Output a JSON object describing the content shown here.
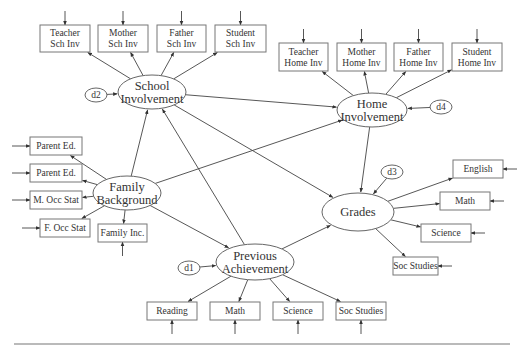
{
  "diagram": {
    "type": "structural-equation-path-model",
    "colors": {
      "stroke": "#444444",
      "box_border": "#777777",
      "text": "#333333",
      "background": "#ffffff"
    },
    "latent": [
      {
        "id": "school",
        "lines": [
          "School",
          "Involvement"
        ],
        "cx": 152,
        "cy": 92,
        "rx": 34,
        "ry": 17
      },
      {
        "id": "home",
        "lines": [
          "Home",
          "Involvement"
        ],
        "cx": 372,
        "cy": 110,
        "rx": 35,
        "ry": 17
      },
      {
        "id": "family",
        "lines": [
          "Family",
          "Background"
        ],
        "cx": 127,
        "cy": 193,
        "rx": 34,
        "ry": 17
      },
      {
        "id": "grades",
        "lines": [
          "Grades"
        ],
        "cx": 358,
        "cy": 212,
        "rx": 36,
        "ry": 19
      },
      {
        "id": "prev",
        "lines": [
          "Previous",
          "Achievement"
        ],
        "cx": 255,
        "cy": 262,
        "rx": 39,
        "ry": 18
      }
    ],
    "errors": [
      {
        "id": "d2",
        "label": "d2",
        "cx": 96,
        "cy": 95,
        "target": "school"
      },
      {
        "id": "d4",
        "label": "d4",
        "cx": 441,
        "cy": 107,
        "target": "home"
      },
      {
        "id": "d3",
        "label": "d3",
        "cx": 392,
        "cy": 172,
        "target": "grades"
      },
      {
        "id": "d1",
        "label": "d1",
        "cx": 189,
        "cy": 268,
        "target": "prev"
      }
    ],
    "indicators": [
      {
        "id": "t_sch",
        "lines": [
          "Teacher",
          "Sch Inv"
        ],
        "x": 40,
        "y": 25,
        "w": 50,
        "h": 27,
        "factor": "school",
        "err": "top"
      },
      {
        "id": "m_sch",
        "lines": [
          "Mother",
          "Sch Inv"
        ],
        "x": 98,
        "y": 25,
        "w": 50,
        "h": 27,
        "factor": "school",
        "err": "top"
      },
      {
        "id": "f_sch",
        "lines": [
          "Father",
          "Sch Inv"
        ],
        "x": 157,
        "y": 25,
        "w": 49,
        "h": 27,
        "factor": "school",
        "err": "top"
      },
      {
        "id": "s_sch",
        "lines": [
          "Student",
          "Sch Inv"
        ],
        "x": 215,
        "y": 25,
        "w": 51,
        "h": 27,
        "factor": "school",
        "err": "top"
      },
      {
        "id": "t_home",
        "lines": [
          "Teacher",
          "Home Inv"
        ],
        "x": 279,
        "y": 43,
        "w": 49,
        "h": 28,
        "factor": "home",
        "err": "top"
      },
      {
        "id": "m_home",
        "lines": [
          "Mother",
          "Home Inv"
        ],
        "x": 337,
        "y": 43,
        "w": 49,
        "h": 28,
        "factor": "home",
        "err": "top"
      },
      {
        "id": "f_home",
        "lines": [
          "Father",
          "Home Inv"
        ],
        "x": 394,
        "y": 43,
        "w": 49,
        "h": 28,
        "factor": "home",
        "err": "top"
      },
      {
        "id": "s_home",
        "lines": [
          "Student",
          "Home Inv"
        ],
        "x": 452,
        "y": 43,
        "w": 50,
        "h": 28,
        "factor": "home",
        "err": "top"
      },
      {
        "id": "pe1",
        "lines": [
          "Parent Ed."
        ],
        "x": 30,
        "y": 137,
        "w": 52,
        "h": 18,
        "factor": "family",
        "err": "left"
      },
      {
        "id": "pe2",
        "lines": [
          "Parent Ed."
        ],
        "x": 30,
        "y": 164,
        "w": 52,
        "h": 18,
        "factor": "family",
        "err": "left"
      },
      {
        "id": "mocc",
        "lines": [
          "M. Occ Stat"
        ],
        "x": 30,
        "y": 191,
        "w": 52,
        "h": 18,
        "factor": "family",
        "err": "left"
      },
      {
        "id": "focc",
        "lines": [
          "F. Occ Stat"
        ],
        "x": 40,
        "y": 219,
        "w": 50,
        "h": 18,
        "factor": "family",
        "err": "left"
      },
      {
        "id": "finc",
        "lines": [
          "Family Inc."
        ],
        "x": 98,
        "y": 224,
        "w": 49,
        "h": 18,
        "factor": "family",
        "err": "bottom"
      },
      {
        "id": "eng",
        "lines": [
          "English"
        ],
        "x": 453,
        "y": 160,
        "w": 50,
        "h": 18,
        "factor": "grades",
        "err": "right"
      },
      {
        "id": "gmath",
        "lines": [
          "Math"
        ],
        "x": 440,
        "y": 192,
        "w": 50,
        "h": 18,
        "factor": "grades",
        "err": "right"
      },
      {
        "id": "gsci",
        "lines": [
          "Science"
        ],
        "x": 421,
        "y": 224,
        "w": 50,
        "h": 18,
        "factor": "grades",
        "err": "right"
      },
      {
        "id": "gsoc",
        "lines": [
          "Soc Studies"
        ],
        "x": 393,
        "y": 257,
        "w": 45,
        "h": 18,
        "factor": "grades",
        "err": "right"
      },
      {
        "id": "read",
        "lines": [
          "Reading"
        ],
        "x": 147,
        "y": 302,
        "w": 50,
        "h": 18,
        "factor": "prev",
        "err": "bottom"
      },
      {
        "id": "pmath",
        "lines": [
          "Math"
        ],
        "x": 210,
        "y": 302,
        "w": 50,
        "h": 18,
        "factor": "prev",
        "err": "bottom"
      },
      {
        "id": "psci",
        "lines": [
          "Science"
        ],
        "x": 273,
        "y": 302,
        "w": 50,
        "h": 18,
        "factor": "prev",
        "err": "bottom"
      },
      {
        "id": "psoc",
        "lines": [
          "Soc Studies"
        ],
        "x": 336,
        "y": 302,
        "w": 50,
        "h": 18,
        "factor": "prev",
        "err": "bottom"
      }
    ],
    "structural_paths": [
      {
        "from": "family",
        "to": "school"
      },
      {
        "from": "family",
        "to": "home"
      },
      {
        "from": "family",
        "to": "prev"
      },
      {
        "from": "prev",
        "to": "school"
      },
      {
        "from": "prev",
        "to": "grades"
      },
      {
        "from": "school",
        "to": "home"
      },
      {
        "from": "school",
        "to": "grades"
      },
      {
        "from": "home",
        "to": "grades"
      }
    ],
    "footer_rule": {
      "x1": 14,
      "x2": 510,
      "y": 344
    }
  }
}
